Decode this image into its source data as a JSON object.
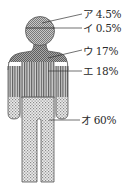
{
  "diagram": {
    "type": "body-region-distribution",
    "regions": [
      {
        "key": "a",
        "mark": "ア",
        "value": "4.5%",
        "label": "ア 4.5%",
        "pattern": "crosshatch"
      },
      {
        "key": "i",
        "mark": "イ",
        "value": "0.5%",
        "label": "イ 0.5%",
        "pattern": "crosshatch"
      },
      {
        "key": "u",
        "mark": "ウ",
        "value": "17%",
        "label": "ウ 17%",
        "pattern": "crosshatch-dark"
      },
      {
        "key": "e",
        "mark": "エ",
        "value": "18%",
        "label": "エ 18%",
        "pattern": "vertical-stripes"
      },
      {
        "key": "o",
        "mark": "オ",
        "value": "60%",
        "label": "オ 60%",
        "pattern": "dots"
      }
    ],
    "colors": {
      "outline": "#555555",
      "crosshatch": "#9a9a9a",
      "stripes": "#6e6e6e",
      "dots": "#b5b5b5",
      "text": "#2a2a2a"
    }
  }
}
